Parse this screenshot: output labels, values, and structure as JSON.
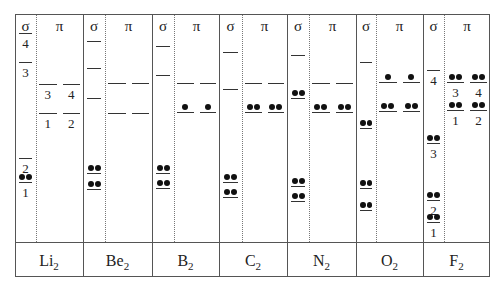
{
  "headers": {
    "sigma": "σ",
    "pi": "π"
  },
  "molecules": [
    {
      "name": "Li",
      "sub": "2",
      "left": 15,
      "right": 83,
      "dotted": 36,
      "sigma": [
        {
          "y": 33,
          "e": 0,
          "label": "4"
        },
        {
          "y": 62,
          "e": 0,
          "label": "3"
        },
        {
          "y": 158,
          "e": 0,
          "label": "2"
        },
        {
          "y": 182,
          "e": 2,
          "label": "1"
        }
      ],
      "pi": [
        {
          "y": 84,
          "e": 0,
          "labels": [
            "3",
            "4"
          ]
        },
        {
          "y": 113,
          "e": 0,
          "labels": [
            "1",
            "2"
          ]
        }
      ]
    },
    {
      "name": "Be",
      "sub": "2",
      "left": 83,
      "right": 152,
      "dotted": 105,
      "sigma": [
        {
          "y": 41,
          "e": 0
        },
        {
          "y": 68,
          "e": 0
        },
        {
          "y": 98,
          "e": 0
        },
        {
          "y": 173,
          "e": 2
        },
        {
          "y": 189,
          "e": 2
        }
      ],
      "pi": [
        {
          "y": 83,
          "e": 0
        },
        {
          "y": 113,
          "e": 0
        }
      ]
    },
    {
      "name": "B",
      "sub": "2",
      "left": 152,
      "right": 219,
      "dotted": 174,
      "sigma": [
        {
          "y": 46,
          "e": 0
        },
        {
          "y": 75,
          "e": 0
        },
        {
          "y": 173,
          "e": 2
        },
        {
          "y": 188,
          "e": 2
        }
      ],
      "pi": [
        {
          "y": 83,
          "e": 0
        },
        {
          "y": 112,
          "e": 1
        }
      ]
    },
    {
      "name": "C",
      "sub": "2",
      "left": 219,
      "right": 287,
      "dotted": 242,
      "sigma": [
        {
          "y": 52,
          "e": 0
        },
        {
          "y": 89,
          "e": 0
        },
        {
          "y": 182,
          "e": 2
        },
        {
          "y": 197,
          "e": 2
        }
      ],
      "pi": [
        {
          "y": 83,
          "e": 0
        },
        {
          "y": 112,
          "e": 2
        }
      ]
    },
    {
      "name": "N",
      "sub": "2",
      "left": 287,
      "right": 356,
      "dotted": 309,
      "sigma": [
        {
          "y": 55,
          "e": 0
        },
        {
          "y": 98,
          "e": 2
        },
        {
          "y": 186,
          "e": 2
        },
        {
          "y": 201,
          "e": 2
        }
      ],
      "pi": [
        {
          "y": 83,
          "e": 0
        },
        {
          "y": 112,
          "e": 2
        }
      ]
    },
    {
      "name": "O",
      "sub": "2",
      "left": 356,
      "right": 423,
      "dotted": 376,
      "sigma": [
        {
          "y": 62,
          "e": 0
        },
        {
          "y": 128,
          "e": 2
        },
        {
          "y": 188,
          "e": 2
        },
        {
          "y": 210,
          "e": 2
        }
      ],
      "pi": [
        {
          "y": 82,
          "e": 1
        },
        {
          "y": 111,
          "e": 2
        }
      ]
    },
    {
      "name": "F",
      "sub": "2",
      "left": 423,
      "right": 490,
      "dotted": 444,
      "sigma": [
        {
          "y": 70,
          "e": 0,
          "label": "4"
        },
        {
          "y": 143,
          "e": 2,
          "label": "3"
        },
        {
          "y": 200,
          "e": 2,
          "label": "2"
        },
        {
          "y": 222,
          "e": 2,
          "label": "1"
        }
      ],
      "pi": [
        {
          "y": 82,
          "e": 2,
          "labels": [
            "3",
            "4"
          ]
        },
        {
          "y": 110,
          "e": 2,
          "labels": [
            "1",
            "2"
          ]
        }
      ]
    }
  ]
}
